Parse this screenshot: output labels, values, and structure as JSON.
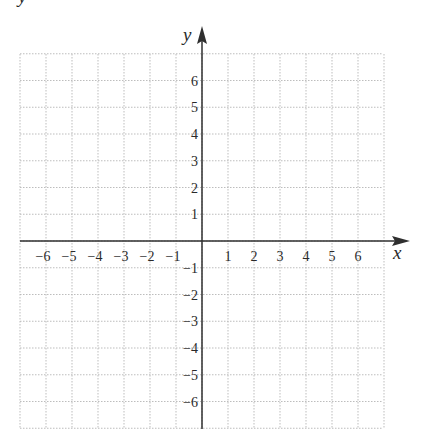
{
  "chart_data": {
    "type": "scatter",
    "title": "",
    "xlabel": "x",
    "ylabel": "y",
    "xlim": [
      -7,
      7
    ],
    "ylim": [
      -7,
      7
    ],
    "grid": true,
    "x_ticks": [
      -6,
      -5,
      -4,
      -3,
      -2,
      -1,
      1,
      2,
      3,
      4,
      5,
      6
    ],
    "y_ticks": [
      -6,
      -5,
      -4,
      -3,
      -2,
      -1,
      1,
      2,
      3,
      4,
      5,
      6
    ],
    "x_tick_labels": [
      "−6",
      "−5",
      "−4",
      "−3",
      "−2",
      "−1",
      "1",
      "2",
      "3",
      "4",
      "5",
      "6"
    ],
    "y_tick_labels": [
      "6",
      "5",
      "4",
      "3",
      "2",
      "1",
      "−1",
      "−2",
      "−3",
      "−4",
      "−5",
      "−6"
    ],
    "series": [],
    "legend": null
  },
  "labels": {
    "x_axis": "x",
    "y_axis": "y",
    "corner_fragment": "y"
  },
  "colors": {
    "axis": "#2f2f2f",
    "grid": "#b5b5b5",
    "text": "#2a2a2a",
    "background": "#ffffff"
  }
}
